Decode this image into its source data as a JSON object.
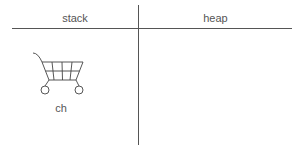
{
  "headers": {
    "stack": "stack",
    "heap": "heap"
  },
  "stack": {
    "variables": [
      {
        "name": "ch",
        "icon": "shopping-cart-icon"
      }
    ]
  },
  "colors": {
    "line": "#555555",
    "background": "#ffffff"
  }
}
